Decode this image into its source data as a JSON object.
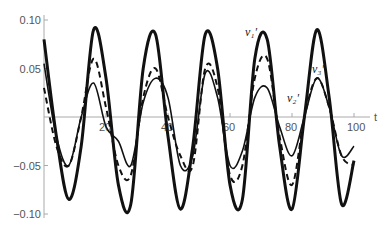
{
  "chart_data": {
    "type": "line",
    "title": "",
    "xlabel": "t",
    "ylabel": "",
    "xlim": [
      0,
      100
    ],
    "ylim": [
      -0.1,
      0.1
    ],
    "grid": false,
    "legend_position": "inline labels",
    "x_ticks": [
      "20",
      "40",
      "60",
      "80",
      "100"
    ],
    "y_ticks": [
      "0.10",
      "0.05",
      "-0.05",
      "-0.10"
    ],
    "annotations": [
      "v₁′",
      "v₂′",
      "v₃′"
    ],
    "x": [
      0,
      4,
      8,
      12,
      16,
      20,
      24,
      28,
      32,
      36,
      40,
      44,
      48,
      52,
      56,
      60,
      64,
      68,
      72,
      76,
      80,
      84,
      88,
      92,
      96,
      100
    ],
    "series": [
      {
        "name": "v1'",
        "style": "solid-thick",
        "values": [
          0.08,
          -0.02,
          -0.085,
          -0.03,
          0.09,
          0.04,
          -0.07,
          -0.09,
          0.05,
          0.085,
          -0.02,
          -0.095,
          -0.03,
          0.085,
          0.05,
          -0.07,
          -0.085,
          0.06,
          0.08,
          -0.03,
          -0.095,
          0.0,
          0.09,
          0.02,
          -0.09,
          -0.045
        ]
      },
      {
        "name": "v2'",
        "style": "dashed",
        "values": [
          0.03,
          -0.03,
          -0.05,
          0.0,
          0.06,
          0.01,
          -0.05,
          -0.06,
          0.02,
          0.05,
          0.0,
          -0.04,
          -0.05,
          0.05,
          0.03,
          -0.06,
          -0.05,
          0.04,
          0.06,
          -0.02,
          -0.07,
          0.0,
          0.04,
          0.01,
          -0.04,
          -0.05
        ]
      },
      {
        "name": "v3'",
        "style": "solid-thin",
        "values": [
          0.055,
          -0.02,
          -0.05,
          0.0,
          0.035,
          -0.01,
          -0.025,
          -0.05,
          0.015,
          0.04,
          0.02,
          -0.05,
          -0.04,
          0.045,
          0.02,
          -0.05,
          -0.035,
          0.02,
          0.03,
          -0.01,
          -0.04,
          0.0,
          0.04,
          0.01,
          -0.04,
          -0.03
        ]
      }
    ]
  },
  "labels": {
    "x_axis": "t",
    "v1": "v₁′",
    "v2": "v₂′",
    "v3": "v₃′"
  }
}
